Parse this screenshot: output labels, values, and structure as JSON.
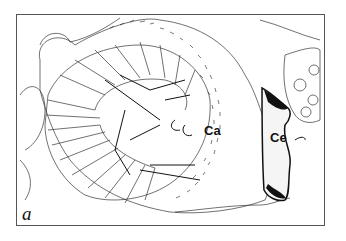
{
  "figure": {
    "panel_label": "a",
    "labels": [
      {
        "text": "Ca",
        "x": 204,
        "y": 123
      },
      {
        "text": "Ce",
        "x": 270,
        "y": 130
      }
    ],
    "colors": {
      "line": "#222222",
      "background": "#ffffff",
      "frame": "#555555"
    }
  }
}
